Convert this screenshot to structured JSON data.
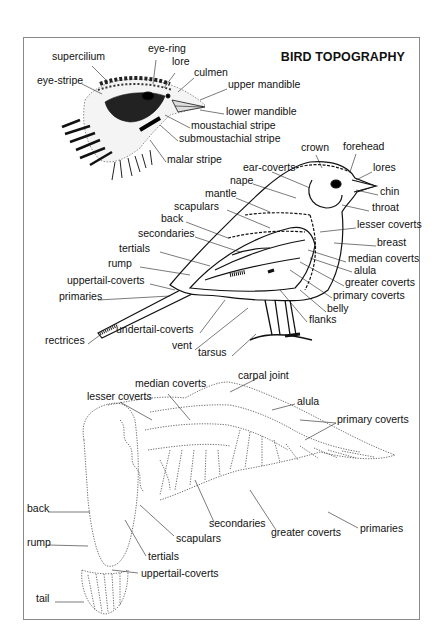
{
  "title": "BIRD TOPOGRAPHY",
  "colors": {
    "ink": "#111111",
    "frame": "#8a8a8a",
    "background": "#ffffff"
  },
  "head_figure": {
    "labels": [
      {
        "text": "supercilium",
        "x": 52,
        "y": 56
      },
      {
        "text": "eye-ring",
        "x": 148,
        "y": 48
      },
      {
        "text": "lore",
        "x": 172,
        "y": 61
      },
      {
        "text": "eye-stripe",
        "x": 37,
        "y": 80
      },
      {
        "text": "culmen",
        "x": 194,
        "y": 72
      },
      {
        "text": "upper mandible",
        "x": 228,
        "y": 84
      },
      {
        "text": "lower mandible",
        "x": 226,
        "y": 111
      },
      {
        "text": "moustachial stripe",
        "x": 191,
        "y": 125
      },
      {
        "text": "submoustachial stripe",
        "x": 179,
        "y": 138
      },
      {
        "text": "malar stripe",
        "x": 167,
        "y": 159
      }
    ]
  },
  "side_figure": {
    "labels": [
      {
        "text": "crown",
        "x": 301,
        "y": 147
      },
      {
        "text": "forehead",
        "x": 343,
        "y": 146
      },
      {
        "text": "ear-coverts",
        "x": 243,
        "y": 167
      },
      {
        "text": "lores",
        "x": 373,
        "y": 167
      },
      {
        "text": "nape",
        "x": 230,
        "y": 180
      },
      {
        "text": "mantle",
        "x": 205,
        "y": 193
      },
      {
        "text": "chin",
        "x": 380,
        "y": 191
      },
      {
        "text": "scapulars",
        "x": 174,
        "y": 206
      },
      {
        "text": "throat",
        "x": 372,
        "y": 207
      },
      {
        "text": "back",
        "x": 161,
        "y": 218
      },
      {
        "text": "secondaries",
        "x": 138,
        "y": 233
      },
      {
        "text": "lesser coverts",
        "x": 357,
        "y": 224
      },
      {
        "text": "tertials",
        "x": 119,
        "y": 248
      },
      {
        "text": "breast",
        "x": 377,
        "y": 242
      },
      {
        "text": "rump",
        "x": 108,
        "y": 263
      },
      {
        "text": "median coverts",
        "x": 348,
        "y": 258
      },
      {
        "text": "alula",
        "x": 354,
        "y": 270
      },
      {
        "text": "uppertail-coverts",
        "x": 67,
        "y": 280
      },
      {
        "text": "greater coverts",
        "x": 345,
        "y": 282
      },
      {
        "text": "primary coverts",
        "x": 333,
        "y": 295
      },
      {
        "text": "primaries",
        "x": 59,
        "y": 296
      },
      {
        "text": "belly",
        "x": 327,
        "y": 308
      },
      {
        "text": "flanks",
        "x": 309,
        "y": 319
      },
      {
        "text": "undertail-coverts",
        "x": 116,
        "y": 329
      },
      {
        "text": "rectrices",
        "x": 45,
        "y": 340
      },
      {
        "text": "vent",
        "x": 172,
        "y": 345
      },
      {
        "text": "tarsus",
        "x": 198,
        "y": 352
      }
    ]
  },
  "wing_figure": {
    "labels": [
      {
        "text": "carpal joint",
        "x": 238,
        "y": 375
      },
      {
        "text": "median coverts",
        "x": 135,
        "y": 383
      },
      {
        "text": "lesser coverts",
        "x": 87,
        "y": 396
      },
      {
        "text": "alula",
        "x": 297,
        "y": 401
      },
      {
        "text": "primary coverts",
        "x": 337,
        "y": 419
      },
      {
        "text": "back",
        "x": 27,
        "y": 508
      },
      {
        "text": "secondaries",
        "x": 209,
        "y": 523
      },
      {
        "text": "greater coverts",
        "x": 271,
        "y": 532
      },
      {
        "text": "primaries",
        "x": 360,
        "y": 528
      },
      {
        "text": "scapulars",
        "x": 176,
        "y": 538
      },
      {
        "text": "rump",
        "x": 27,
        "y": 542
      },
      {
        "text": "tertials",
        "x": 148,
        "y": 556
      },
      {
        "text": "uppertail-coverts",
        "x": 141,
        "y": 573
      },
      {
        "text": "tail",
        "x": 36,
        "y": 598
      }
    ]
  }
}
